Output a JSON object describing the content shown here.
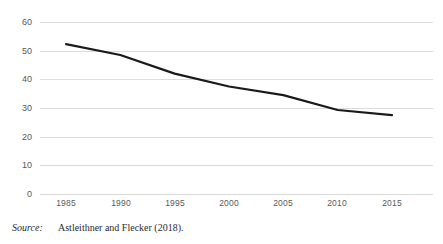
{
  "figure": {
    "source_label": "Source:",
    "source_text": "Astleithner and Flecker (2018)."
  },
  "chart_data": {
    "type": "line",
    "title": "",
    "subtitle": "",
    "xlabel": "",
    "ylabel": "",
    "x": [
      1985,
      1990,
      1995,
      2000,
      2005,
      2010,
      2015
    ],
    "categories": [
      "1985",
      "1990",
      "1995",
      "2000",
      "2005",
      "2010",
      "2015"
    ],
    "series": [
      {
        "name": "",
        "values": [
          52.3,
          48.5,
          42.0,
          37.5,
          34.5,
          29.3,
          27.5
        ],
        "color": "#1a1a1a",
        "line_width": 2.2
      }
    ],
    "xlim": [
      1985,
      2015
    ],
    "ylim": [
      0,
      60
    ],
    "yticks": [
      0,
      10,
      20,
      30,
      40,
      50,
      60
    ],
    "ytick_labels": [
      "0",
      "10",
      "20",
      "30",
      "40",
      "50",
      "60"
    ],
    "xticks": [
      1985,
      1990,
      1995,
      2000,
      2005,
      2010,
      2015
    ],
    "xtick_labels": [
      "1985",
      "1990",
      "1995",
      "2000",
      "2005",
      "2010",
      "2015"
    ],
    "grid": "horizontal",
    "grid_color": "#dcdcdc",
    "legend": "none",
    "background": "#ffffff"
  }
}
